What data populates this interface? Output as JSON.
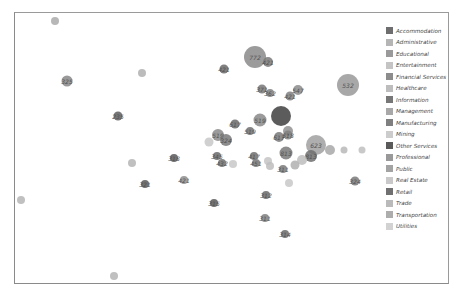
{
  "chart_data": {
    "type": "scatter",
    "subtype": "bubble",
    "title": "",
    "xlabel": "",
    "ylabel": "",
    "grid": false,
    "legend_position": "right",
    "legend": [
      {
        "name": "Accommodation",
        "color": "#6e6e6e"
      },
      {
        "name": "Administrative",
        "color": "#b5b5b5"
      },
      {
        "name": "Educational",
        "color": "#9a9a9a"
      },
      {
        "name": "Entertainment",
        "color": "#c4c4c4"
      },
      {
        "name": "Financial Services",
        "color": "#8c8c8c"
      },
      {
        "name": "Healthcare",
        "color": "#bdbdbd"
      },
      {
        "name": "Information",
        "color": "#777777"
      },
      {
        "name": "Management",
        "color": "#a8a8a8"
      },
      {
        "name": "Manufacturing",
        "color": "#7f7f7f"
      },
      {
        "name": "Mining",
        "color": "#cccccc"
      },
      {
        "name": "Other Services",
        "color": "#5a5a5a"
      },
      {
        "name": "Professional",
        "color": "#999999"
      },
      {
        "name": "Public",
        "color": "#a3a3a3"
      },
      {
        "name": "Real Estate",
        "color": "#c9c9c9"
      },
      {
        "name": "Retail",
        "color": "#707070"
      },
      {
        "name": "Trade",
        "color": "#bababa"
      },
      {
        "name": "Transportation",
        "color": "#adadad"
      },
      {
        "name": "Utilities",
        "color": "#d2d2d2"
      }
    ],
    "points": [
      {
        "px": 55,
        "py": 21,
        "r": 4,
        "label": "",
        "color": "#aaaaaa"
      },
      {
        "px": 67,
        "py": 81,
        "r": 5.5,
        "label": "325",
        "color": "#888888"
      },
      {
        "px": 142,
        "py": 73,
        "r": 4,
        "label": "",
        "color": "#b0b0b0"
      },
      {
        "px": 255,
        "py": 57,
        "r": 11,
        "label": "772",
        "color": "#8a8a8a"
      },
      {
        "px": 268,
        "py": 62,
        "r": 5,
        "label": "421",
        "color": "#7a7a7a"
      },
      {
        "px": 224,
        "py": 69,
        "r": 4.5,
        "label": "421",
        "color": "#6a6a6a"
      },
      {
        "px": 348,
        "py": 85,
        "r": 11,
        "label": "532",
        "color": "#9a9a9a"
      },
      {
        "px": 262,
        "py": 89,
        "r": 4.5,
        "label": "371",
        "color": "#777777"
      },
      {
        "px": 270,
        "py": 93,
        "r": 4,
        "label": "362",
        "color": "#808080"
      },
      {
        "px": 298,
        "py": 90,
        "r": 5,
        "label": "547",
        "color": "#8c8c8c"
      },
      {
        "px": 290,
        "py": 96,
        "r": 4.5,
        "label": "421",
        "color": "#7f7f7f"
      },
      {
        "px": 118,
        "py": 116,
        "r": 4.5,
        "label": "235",
        "color": "#5f5f5f"
      },
      {
        "px": 281,
        "py": 116,
        "r": 10,
        "label": "",
        "color": "#3f3f3f"
      },
      {
        "px": 260,
        "py": 120,
        "r": 6.5,
        "label": "519",
        "color": "#8a8a8a"
      },
      {
        "px": 235,
        "py": 124,
        "r": 4.5,
        "label": "617",
        "color": "#6a6a6a"
      },
      {
        "px": 250,
        "py": 131,
        "r": 4,
        "label": "519",
        "color": "#707070"
      },
      {
        "px": 288,
        "py": 131,
        "r": 5,
        "label": "",
        "color": "#909090"
      },
      {
        "px": 218,
        "py": 135,
        "r": 6,
        "label": "519",
        "color": "#8a8a8a"
      },
      {
        "px": 226,
        "py": 140,
        "r": 6,
        "label": "324",
        "color": "#7a7a7a"
      },
      {
        "px": 209,
        "py": 142,
        "r": 4.5,
        "label": "",
        "color": "#c8c8c8"
      },
      {
        "px": 279,
        "py": 137,
        "r": 5,
        "label": "617",
        "color": "#7a7a7a"
      },
      {
        "px": 288,
        "py": 135,
        "r": 4.5,
        "label": "518",
        "color": "#808080"
      },
      {
        "px": 316,
        "py": 145,
        "r": 10,
        "label": "623",
        "color": "#a0a0a0"
      },
      {
        "px": 330,
        "py": 150,
        "r": 5,
        "label": "",
        "color": "#a8a8a8"
      },
      {
        "px": 344,
        "py": 150,
        "r": 3.5,
        "label": "",
        "color": "#b8b8b8"
      },
      {
        "px": 362,
        "py": 150,
        "r": 3.5,
        "label": "",
        "color": "#c0c0c0"
      },
      {
        "px": 286,
        "py": 153,
        "r": 6.5,
        "label": "813",
        "color": "#7a7a7a"
      },
      {
        "px": 311,
        "py": 156,
        "r": 6,
        "label": "813",
        "color": "#6f6f6f"
      },
      {
        "px": 302,
        "py": 160,
        "r": 5,
        "label": "",
        "color": "#bdbdbd"
      },
      {
        "px": 217,
        "py": 156,
        "r": 4,
        "label": "345",
        "color": "#6a6a6a"
      },
      {
        "px": 222,
        "py": 163,
        "r": 4,
        "label": "432",
        "color": "#707070"
      },
      {
        "px": 233,
        "py": 164,
        "r": 4,
        "label": "",
        "color": "#c8c8c8"
      },
      {
        "px": 254,
        "py": 156,
        "r": 4,
        "label": "417",
        "color": "#6f6f6f"
      },
      {
        "px": 256,
        "py": 163,
        "r": 4,
        "label": "451",
        "color": "#777777"
      },
      {
        "px": 268,
        "py": 161,
        "r": 4,
        "label": "",
        "color": "#c4c4c4"
      },
      {
        "px": 270,
        "py": 166,
        "r": 4,
        "label": "",
        "color": "#bdbdbd"
      },
      {
        "px": 283,
        "py": 169,
        "r": 4,
        "label": "311",
        "color": "#7a7a7a"
      },
      {
        "px": 295,
        "py": 165,
        "r": 4.5,
        "label": "",
        "color": "#b0b0b0"
      },
      {
        "px": 289,
        "py": 183,
        "r": 4,
        "label": "",
        "color": "#c8c8c8"
      },
      {
        "px": 174,
        "py": 158,
        "r": 4,
        "label": "318",
        "color": "#5a5a5a"
      },
      {
        "px": 132,
        "py": 163,
        "r": 4,
        "label": "",
        "color": "#b5b5b5"
      },
      {
        "px": 184,
        "py": 180,
        "r": 4,
        "label": "421",
        "color": "#8f8f8f"
      },
      {
        "px": 145,
        "py": 184,
        "r": 4,
        "label": "321",
        "color": "#5a5a5a"
      },
      {
        "px": 355,
        "py": 181,
        "r": 4.5,
        "label": "324",
        "color": "#7a7a7a"
      },
      {
        "px": 266,
        "py": 195,
        "r": 4,
        "label": "312",
        "color": "#6a6a6a"
      },
      {
        "px": 214,
        "py": 203,
        "r": 4,
        "label": "315",
        "color": "#5a5a5a"
      },
      {
        "px": 265,
        "py": 218,
        "r": 4,
        "label": "311",
        "color": "#808080"
      },
      {
        "px": 285,
        "py": 234,
        "r": 4,
        "label": "314",
        "color": "#6a6a6a"
      },
      {
        "px": 21,
        "py": 200,
        "r": 4,
        "label": "",
        "color": "#b5b5b5"
      },
      {
        "px": 114,
        "py": 276,
        "r": 4,
        "label": "",
        "color": "#b5b5b5"
      }
    ]
  }
}
